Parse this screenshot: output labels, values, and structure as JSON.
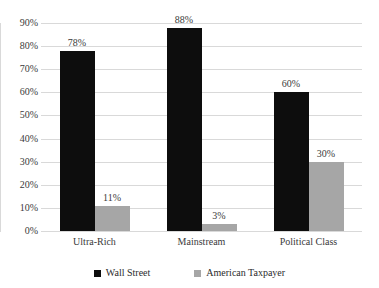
{
  "chart_data": {
    "type": "bar",
    "title": "",
    "subtitle": "",
    "xlabel": "",
    "ylabel": "",
    "categories": [
      "Ultra-Rich",
      "Mainstream",
      "Political Class"
    ],
    "series": [
      {
        "name": "Wall Street",
        "color": "#0d0d0d",
        "values": [
          78,
          88,
          60
        ],
        "labels": [
          "78%",
          "88%",
          "60%"
        ]
      },
      {
        "name": "American Taxpayer",
        "color": "#a6a6a6",
        "values": [
          11,
          3,
          30
        ],
        "labels": [
          "11%",
          "3%",
          "30%"
        ]
      }
    ],
    "ylim": [
      0,
      90
    ],
    "ytick_values": [
      90,
      80,
      70,
      60,
      50,
      40,
      30,
      20,
      10,
      0
    ],
    "ytick_labels": [
      "90%",
      "80%",
      "70%",
      "60%",
      "50%",
      "40%",
      "30%",
      "20%",
      "10%",
      "0%"
    ],
    "grid": true,
    "grid_color": "#d9d9d9",
    "legend_position": "bottom",
    "background": "#ffffff"
  }
}
